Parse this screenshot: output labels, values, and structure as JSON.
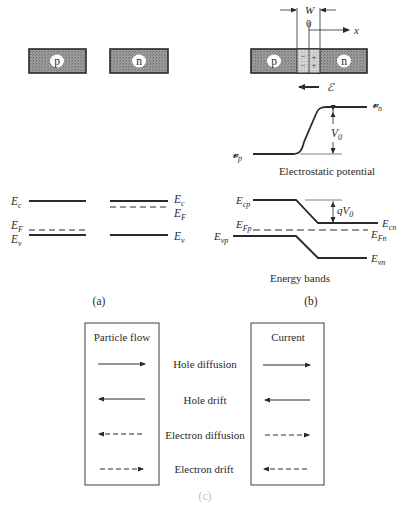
{
  "panel_a": {
    "p_label": "p",
    "n_label": "n",
    "caption": "(a)",
    "p_side": {
      "Ec": "E",
      "Ec_sub": "c",
      "EF": "E",
      "EF_sub": "F",
      "Ev": "E",
      "Ev_sub": "v"
    },
    "n_side": {
      "Ec": "E",
      "Ec_sub": "c",
      "EF": "E",
      "EF_sub": "F",
      "Ev": "E",
      "Ev_sub": "v"
    }
  },
  "panel_b": {
    "W_label": "W",
    "origin_label": "0",
    "x_label": "x",
    "p_label": "p",
    "n_label": "n",
    "minus_label": "−",
    "plus_label": "+",
    "field_label": "ℰ",
    "potential": {
      "vn": "𝓿",
      "vn_sub": "n",
      "vp": "𝓿",
      "vp_sub": "p",
      "V0": "V",
      "V0_sub": "0",
      "caption": "Electrostatic potential"
    },
    "bands": {
      "Ecp": "E",
      "Ecp_sub": "cp",
      "Ecn": "E",
      "Ecn_sub": "cn",
      "EFp": "E",
      "EFp_sub": "Fp",
      "EFn": "E",
      "EFn_sub": "Fn",
      "Evp": "E",
      "Evp_sub": "vp",
      "Evn": "E",
      "Evn_sub": "vn",
      "qV0": "qV",
      "qV0_sub": "0",
      "caption": "Energy bands"
    },
    "caption": "(b)"
  },
  "table": {
    "left_header": "Particle flow",
    "right_header": "Current",
    "rows": [
      {
        "label": "Hole diffusion",
        "particle": "right-solid",
        "current": "right-solid"
      },
      {
        "label": "Hole drift",
        "particle": "left-solid",
        "current": "left-solid"
      },
      {
        "label": "Electron diffusion",
        "particle": "left-dashed",
        "current": "right-dashed"
      },
      {
        "label": "Electron drift",
        "particle": "right-dashed",
        "current": "left-dashed"
      }
    ],
    "caption": "(c)"
  },
  "colors": {
    "ink": "#2a2a2a",
    "fill": "#8e8e8e",
    "depletion": "#c9c9c9"
  }
}
